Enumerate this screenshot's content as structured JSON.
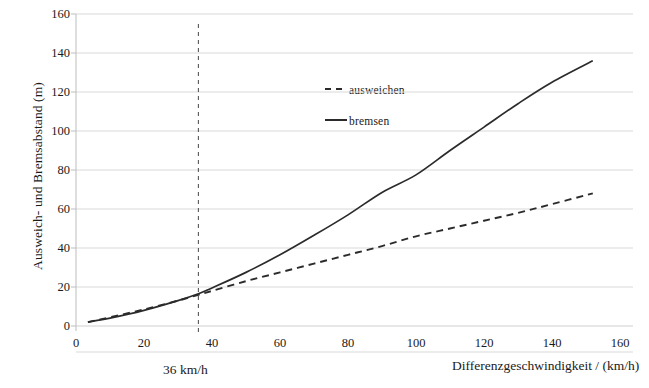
{
  "chart_data": {
    "type": "line",
    "title": "",
    "xlabel": "Differenzgeschwindigkeit / (km/h)",
    "ylabel": "Ausweich- und Bremsabstand (m)",
    "xlim": [
      0,
      160
    ],
    "ylim": [
      0,
      160
    ],
    "xticks": [
      0,
      20,
      40,
      60,
      80,
      100,
      120,
      140,
      160
    ],
    "yticks": [
      0,
      20,
      40,
      60,
      80,
      100,
      120,
      140,
      160
    ],
    "xtick_labels": [
      "0",
      "20",
      "40",
      "60",
      "80",
      "100",
      "120",
      "140",
      "160"
    ],
    "ytick_labels": [
      "0",
      "20",
      "40",
      "60",
      "80",
      "100",
      "120",
      "140",
      "160"
    ],
    "grid": "horizontal",
    "legend_position": "upper-center",
    "series": [
      {
        "name": "ausweichen",
        "style": "dashed",
        "color": "#2b2b2b",
        "x": [
          3.5,
          10,
          20,
          30,
          36,
          40,
          50,
          60,
          70,
          80,
          90,
          100,
          110,
          120,
          130,
          140,
          152
        ],
        "values": [
          2,
          4.5,
          8.5,
          13,
          16,
          18,
          23,
          27.5,
          32,
          36.5,
          41,
          46,
          50,
          54,
          58,
          62.5,
          68
        ]
      },
      {
        "name": "bremsen",
        "style": "solid",
        "color": "#2b2b2b",
        "x": [
          3.5,
          10,
          20,
          30,
          36,
          40,
          50,
          60,
          70,
          80,
          90,
          100,
          110,
          120,
          130,
          140,
          152
        ],
        "values": [
          2,
          4,
          8,
          13,
          16.5,
          19.5,
          27.5,
          36.5,
          46.5,
          57,
          68.5,
          77.5,
          90,
          102,
          114,
          125,
          136
        ]
      }
    ],
    "annotations": [
      {
        "name": "vertical-marker",
        "label": "36 km/h",
        "x_value": 36,
        "style": "dashed-vertical"
      }
    ]
  },
  "legend": {
    "entries": [
      {
        "label": "ausweichen",
        "style": "dashed"
      },
      {
        "label": "bremsen",
        "style": "solid"
      }
    ]
  },
  "colors": {
    "line": "#2b2b2b",
    "grid": "#d9d9d9",
    "axis": "#b4b4b4",
    "text": "#1a1a1a",
    "background": "#ffffff"
  }
}
